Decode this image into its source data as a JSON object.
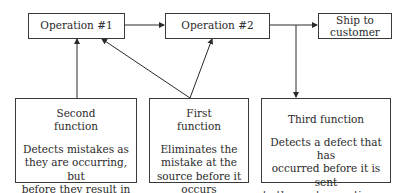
{
  "nodes": {
    "operation1": {
      "label": "Operation #1"
    },
    "operation2": {
      "label": "Operation #2"
    },
    "ship": {
      "label": "Ship to customer",
      "line1": "Ship to",
      "line2": "customer"
    },
    "second_function": {
      "title_line1": "Second",
      "title_line2": "function",
      "desc_lines": [
        "Detects mistakes as",
        "they are occurring, but",
        "before they result in",
        "defects"
      ]
    },
    "first_function": {
      "title_line1": "First",
      "title_line2": "function",
      "desc_lines": [
        "Eliminates the",
        "mistake at the",
        "source before it",
        "occurs"
      ]
    },
    "third_function": {
      "title_line1": "Third function",
      "desc_lines": [
        "Detects a defect that has",
        "occurred before it is sent",
        "to the next operation or",
        "shipped to the customer"
      ]
    }
  },
  "edges": [
    {
      "from": "Operation #1",
      "to": "Operation #2"
    },
    {
      "from": "Operation #2",
      "to": "Ship to customer"
    },
    {
      "from": "Operation #2 → Ship line",
      "to": "Third function"
    },
    {
      "from": "Second function",
      "to": "Operation #1"
    },
    {
      "from": "First function",
      "to": "Operation #1"
    },
    {
      "from": "First function",
      "to": "Operation #2"
    }
  ],
  "colors": {
    "line": "#3a3a3a",
    "text": "#2a2a2a",
    "background": "#ffffff"
  }
}
